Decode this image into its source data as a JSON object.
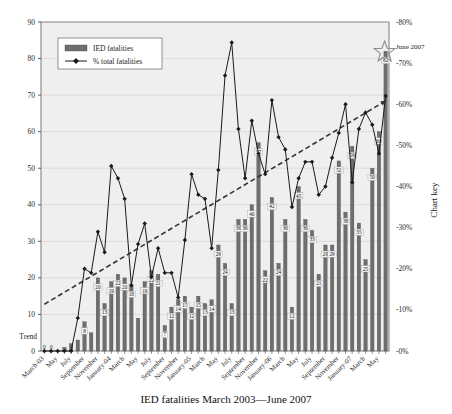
{
  "chart_data": {
    "type": "bar",
    "title": "IED fatalities March 2003—June 2007",
    "xlabel": "IED fatalities March 2003—June 2007",
    "ylabel": "",
    "ylabel_right": "Chart key",
    "ylim": [
      0,
      90
    ],
    "ylim_right": [
      0,
      80
    ],
    "grid": true,
    "legend_position": "top-left",
    "categories": [
      "March-03",
      "April",
      "May",
      "June",
      "July",
      "August",
      "September",
      "October",
      "November",
      "December",
      "January-04",
      "February",
      "March",
      "April",
      "May",
      "June",
      "July",
      "August",
      "September",
      "October",
      "November",
      "December",
      "January-05",
      "February",
      "March",
      "April",
      "May",
      "June",
      "July",
      "August",
      "September",
      "October",
      "November",
      "December",
      "January-06",
      "February",
      "March",
      "April",
      "May",
      "June",
      "July",
      "August",
      "September",
      "October",
      "November",
      "December",
      "January-07",
      "February",
      "March",
      "April",
      "May",
      "June"
    ],
    "xtick_labels": [
      "March-03",
      "May",
      "July",
      "September",
      "November",
      "January-04",
      "March",
      "May",
      "July",
      "September",
      "November",
      "January-05",
      "March",
      "May",
      "July",
      "September",
      "November",
      "January-06",
      "March",
      "May",
      "July",
      "September",
      "November",
      "January-07",
      "March",
      "May"
    ],
    "ytick_labels_left": [
      "0",
      "10",
      "20",
      "30",
      "40",
      "50",
      "60",
      "70",
      "80",
      "90"
    ],
    "ytick_labels_right": [
      "-0%",
      "-10%",
      "-20%",
      "-30%",
      "-40%",
      "-50%",
      "-60%",
      "-70%",
      "-80%"
    ],
    "series": [
      {
        "name": "IED fatalities",
        "type": "bar",
        "color": "#6e6e6e",
        "values": [
          0,
          0,
          0,
          1,
          2,
          3,
          8,
          5,
          20,
          13,
          19,
          21,
          20,
          18,
          9,
          19,
          22,
          21,
          7,
          12,
          14,
          15,
          12,
          15,
          13,
          14,
          29,
          24,
          13,
          36,
          36,
          40,
          57,
          22,
          42,
          24,
          36,
          12,
          45,
          36,
          33,
          21,
          29,
          29,
          52,
          38,
          56,
          35,
          25,
          50,
          60,
          82
        ],
        "visible_labels": [
          null,
          null,
          null,
          null,
          null,
          null,
          "8",
          null,
          "20",
          "13",
          "19",
          "22",
          "20",
          "18",
          null,
          "19",
          "22",
          "21",
          "7",
          "12",
          "14",
          "15",
          "12",
          "15",
          "13",
          "14",
          "29",
          "24",
          "13",
          "36",
          "36",
          "40",
          "57",
          "22",
          "42",
          "24",
          "36",
          "12",
          "45",
          "36",
          "33",
          "21",
          "29",
          "29",
          "52",
          "38",
          "56",
          "35",
          "25",
          "50",
          "60",
          "82"
        ]
      },
      {
        "name": "% total fatalities",
        "type": "line",
        "color": "#1a1a1a",
        "axis": "right",
        "values": [
          0,
          0,
          0,
          0,
          0,
          8,
          20,
          19,
          29,
          24,
          45,
          42,
          37,
          16,
          26,
          31,
          18,
          25,
          19,
          19,
          13,
          27,
          43,
          38,
          37,
          25,
          44,
          67,
          75,
          54,
          42,
          56,
          48,
          43,
          61,
          52,
          49,
          35,
          42,
          46,
          46,
          38,
          40,
          47,
          53,
          60,
          41,
          54,
          58,
          55,
          48,
          62
        ]
      },
      {
        "name": "Trend",
        "type": "trendline",
        "style": "dashed",
        "color": "#3a3a3a"
      }
    ],
    "legend": [
      {
        "label": "IED fatalities",
        "marker": "bar",
        "color": "#6e6e6e"
      },
      {
        "label": "% total fatalities",
        "marker": "line-diamond",
        "color": "#1a1a1a"
      }
    ],
    "annotations": [
      {
        "text": "June 2007",
        "marker": "star",
        "x": 51
      },
      {
        "text": "Trend",
        "position": "left-axis-baseline"
      }
    ],
    "zero_labels": [
      "0",
      "0"
    ]
  }
}
